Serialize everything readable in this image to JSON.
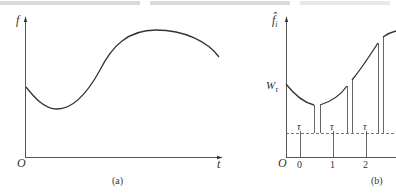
{
  "figure_a": {
    "y_axis_label": "f",
    "x_axis_label": "t",
    "origin_label": "O",
    "caption": "(a)"
  },
  "figure_b": {
    "y_axis_label": "f̂",
    "y_axis_subscript": "i",
    "threshold_label": "W",
    "threshold_subscript": "τ",
    "origin_label": "O",
    "interval_label": "τ",
    "ticks": [
      "0",
      "1",
      "2"
    ],
    "caption": "(b)"
  }
}
